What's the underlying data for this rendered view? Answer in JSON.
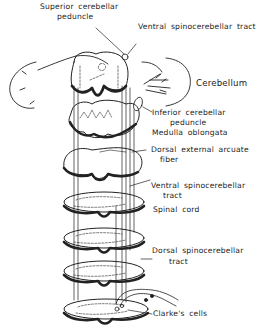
{
  "figure": {
    "type": "anatomical-diagram",
    "labels": {
      "superior_cerebellar_peduncle_1": "Superior cerebellar",
      "superior_cerebellar_peduncle_2": "peduncle",
      "ventral_spinocerebellar_tract_top": "Ventral  spinocerebellar  tract",
      "cerebellum": "Cerebellum",
      "inferior_cerebellar_peduncle_1": "Inferior cerebellar",
      "inferior_cerebellar_peduncle_2": "peduncle",
      "medulla_oblongata": "Medulla  oblongata",
      "dorsal_external_arcuate_fiber_1": "Dorsal  external  arcuate",
      "dorsal_external_arcuate_fiber_2": "fiber",
      "ventral_spinocerebellar_tract_mid_1": "Ventral  spinocerebellar",
      "ventral_spinocerebellar_tract_mid_2": "tract",
      "spinal_cord": "Spinal  cord",
      "dorsal_spinocerebellar_tract_1": "Dorsal  spinocerebellar",
      "dorsal_spinocerebellar_tract_2": "tract",
      "clarkes_cells": "Clarke's  cells"
    },
    "colors": {
      "ink": "#222222",
      "background": "#ffffff"
    }
  }
}
